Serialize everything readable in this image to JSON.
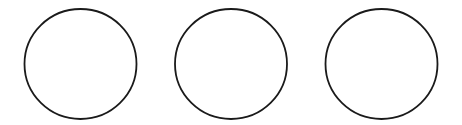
{
  "canvas": {
    "width": 462,
    "height": 125,
    "background": "#ffffff"
  },
  "shapes": [
    {
      "type": "circle",
      "cx": 80.5,
      "cy": 64,
      "rx": 56,
      "ry": 55,
      "stroke": "#1a1a1a",
      "fill": "#ffffff"
    },
    {
      "type": "circle",
      "cx": 231,
      "cy": 64,
      "rx": 56,
      "ry": 55,
      "stroke": "#1a1a1a",
      "fill": "#ffffff"
    },
    {
      "type": "circle",
      "cx": 381.5,
      "cy": 64,
      "rx": 56,
      "ry": 55,
      "stroke": "#1a1a1a",
      "fill": "#ffffff"
    }
  ],
  "stroke_width": 1.8
}
